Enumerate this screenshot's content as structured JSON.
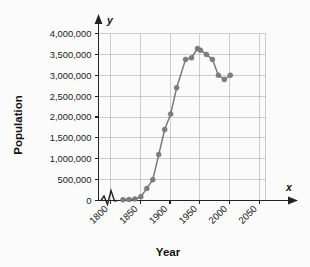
{
  "chart_data": {
    "type": "line",
    "title": "",
    "xlabel": "Year",
    "ylabel": "Population",
    "x_axis_variable": "x",
    "y_axis_variable": "y",
    "xlim": [
      1780,
      2060
    ],
    "ylim": [
      0,
      4200000
    ],
    "xticks": [
      1800,
      1850,
      1900,
      1950,
      2000,
      2050
    ],
    "xtick_labels": [
      "1800",
      "1850",
      "1900",
      "1950",
      "2000",
      "2050"
    ],
    "yticks": [
      0,
      500000,
      1000000,
      1500000,
      2000000,
      2500000,
      3000000,
      3500000,
      4000000
    ],
    "ytick_labels": [
      "0",
      "500,000",
      "1,000,000",
      "1,500,000",
      "2,000,000",
      "2,500,000",
      "3,000,000",
      "3,500,000",
      "4,000,000"
    ],
    "grid": true,
    "legend": false,
    "axis_break": true,
    "axis_break_note": "zigzag break symbol on x-axis just right of origin",
    "marker": "circle",
    "line_color": "#7a7a7a",
    "marker_color": "#7d7d7d",
    "grid_color": "#b9b9bd",
    "axis_color": "#222222",
    "background_color": "#fbfbfc",
    "x": [
      1821,
      1831,
      1841,
      1851,
      1861,
      1871,
      1881,
      1891,
      1901,
      1911,
      1926,
      1936,
      1946,
      1951,
      1961,
      1971,
      1981,
      1991,
      2001
    ],
    "values": [
      20000,
      25000,
      35000,
      90000,
      290000,
      500000,
      1100000,
      1700000,
      2070000,
      2700000,
      3380000,
      3420000,
      3640000,
      3600000,
      3500000,
      3380000,
      3000000,
      2900000,
      3000000
    ],
    "series": [
      {
        "name": "Population",
        "values": [
          20000,
          25000,
          35000,
          90000,
          290000,
          500000,
          1100000,
          1700000,
          2070000,
          2700000,
          3380000,
          3420000,
          3640000,
          3600000,
          3500000,
          3380000,
          3000000,
          2900000,
          3000000
        ]
      }
    ]
  }
}
